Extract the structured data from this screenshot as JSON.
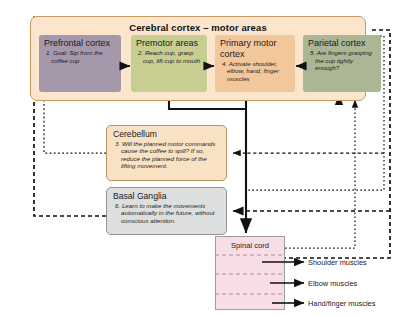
{
  "diagram": {
    "title": "Cerebral cortex – motor areas",
    "cortex_areas": [
      {
        "name": "prefrontal-cortex",
        "heading": "Prefrontal cortex",
        "body": "1. Goal: Sip from the coffee cup",
        "color": "#a698ab"
      },
      {
        "name": "premotor-areas",
        "heading": "Premotor areas",
        "body": "2. Reach cup, grasp cup, lift cup to mouth",
        "color": "#c8cd92"
      },
      {
        "name": "primary-motor-cortex",
        "heading": "Primary motor cortex",
        "body": "4. Activate shoulder, elbow, hand, finger muscles",
        "color": "#f3c79c"
      },
      {
        "name": "parietal-cortex",
        "heading": "Parietal cortex",
        "body": "5. Are fingers grasping the cup tightly enough?",
        "color": "#aab694"
      }
    ],
    "cerebellum": {
      "heading": "Cerebellum",
      "body": "3. Will the planned motor commands cause the coffee to spill? If so, reduce the planned force of the lifting movement.",
      "color": "#f8e2c3"
    },
    "basal_ganglia": {
      "heading": "Basal Ganglia",
      "body": "6. Learn to make the movements automatically in the future, without conscious attention.",
      "color": "#dddfde"
    },
    "spinal_cord": {
      "heading": "Spinal cord",
      "color": "#f7dee6"
    },
    "muscle_outputs": [
      "Shoulder muscles",
      "Elbow muscles",
      "Hand/finger muscles"
    ],
    "colors": {
      "cortex_panel": "#fbe6cd",
      "cortex_border": "#c79a63",
      "arrow": "#111111"
    }
  }
}
